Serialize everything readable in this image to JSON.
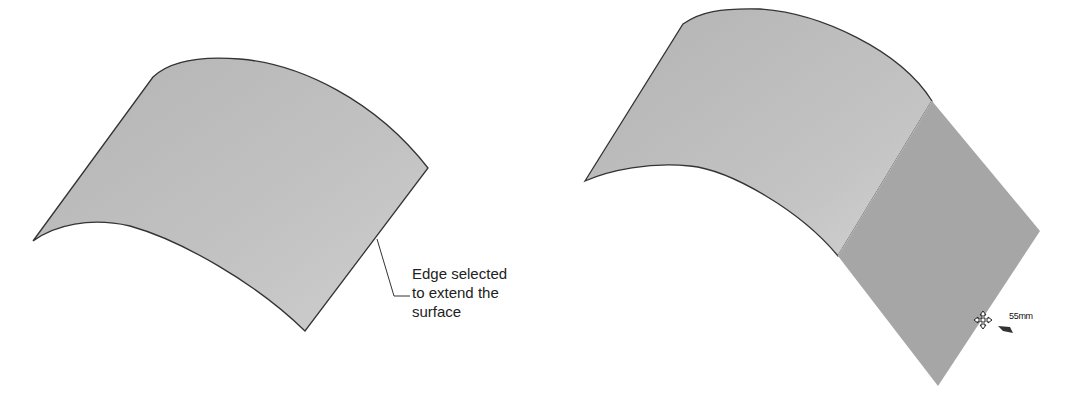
{
  "figure": {
    "left_panel": {
      "description": "Curved surface before extension",
      "callout": {
        "lines": [
          "Edge selected",
          "to extend the",
          "surface"
        ]
      }
    },
    "right_panel": {
      "description": "Surface with planar extension preview",
      "dimension_label": "55mm",
      "cursor_icon": "move-icon"
    },
    "colors": {
      "surface_fill": "#bdbdbd",
      "extension_fill": "#a4a4a4",
      "edge_stroke": "#333333",
      "background": "#ffffff"
    }
  }
}
